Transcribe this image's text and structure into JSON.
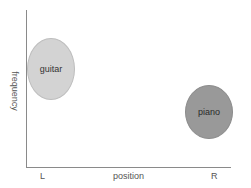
{
  "diagram": {
    "axes": {
      "xlabel": "position",
      "ylabel": "frequency",
      "x_ticks": [
        "L",
        "R"
      ]
    },
    "regions": [
      {
        "label": "guitar",
        "position": "left",
        "frequency": "mid-high",
        "color": "#d3d3d3"
      },
      {
        "label": "piano",
        "position": "right",
        "frequency": "mid-low",
        "color": "#999999"
      }
    ]
  }
}
